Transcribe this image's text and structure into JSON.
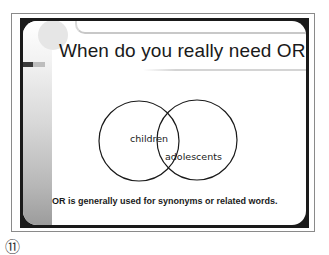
{
  "slide": {
    "title": "When do you really need OR?",
    "venn": {
      "left_label": "children",
      "right_label": "adolescents"
    },
    "caption": "OR is generally used for synonyms or related words."
  },
  "page": {
    "slide_number": "⑪"
  },
  "colors": {
    "frame": "#8a8a8a",
    "border": "#1a1a1a",
    "text": "#1a1a1a"
  }
}
